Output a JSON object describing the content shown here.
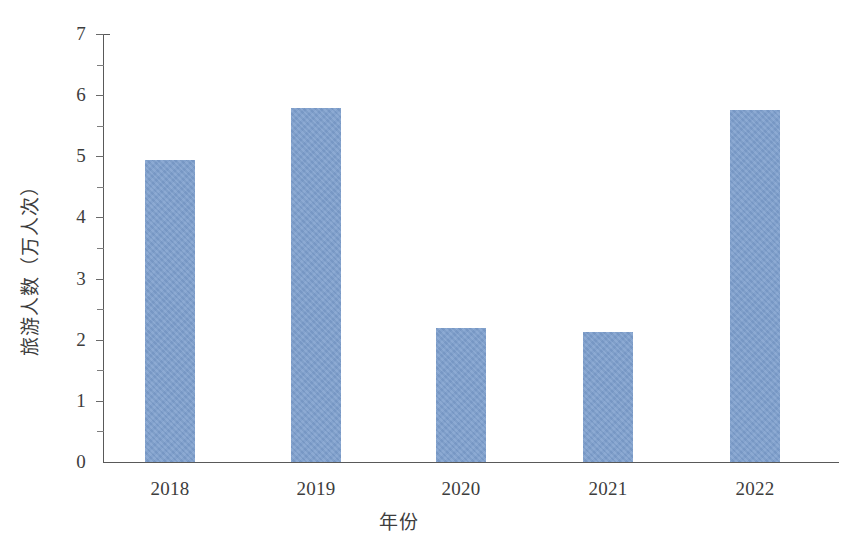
{
  "chart_data": {
    "type": "bar",
    "title": "",
    "subtitle": "",
    "categories": [
      "2018",
      "2019",
      "2020",
      "2021",
      "2022"
    ],
    "values": [
      4.94,
      5.79,
      2.19,
      2.13,
      5.76
    ],
    "xlabel": "年份",
    "ylabel": "旅游人数（万人次）",
    "ylim": [
      0,
      7
    ],
    "ytick_values": [
      0,
      1,
      2,
      3,
      4,
      5,
      6,
      7
    ],
    "ytick_labels": [
      "0",
      "1",
      "2",
      "3",
      "4",
      "5",
      "6",
      "7"
    ],
    "minor_tick_step": 0.5,
    "grid": false,
    "legend": null,
    "series": [
      {
        "name": "旅游人数",
        "values": [
          4.94,
          5.79,
          2.19,
          2.13,
          5.76
        ],
        "color": "#7d9fce"
      }
    ],
    "bar_color": "#7d9fce",
    "axis_color": "#595959",
    "background_color": "#ffffff",
    "text_color": "#3d3d3d"
  }
}
